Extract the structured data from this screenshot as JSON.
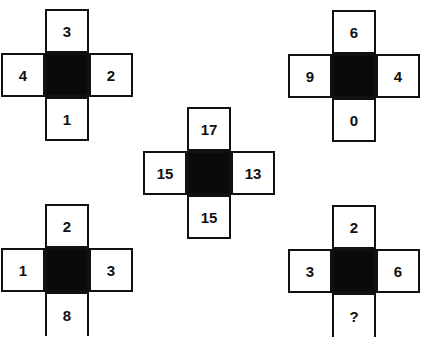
{
  "puzzle": {
    "crosses": [
      {
        "position": "top-left",
        "top": "3",
        "left": "4",
        "right": "2",
        "bottom": "1"
      },
      {
        "position": "top-right",
        "top": "6",
        "left": "9",
        "right": "4",
        "bottom": "0"
      },
      {
        "position": "center",
        "top": "17",
        "left": "15",
        "right": "13",
        "bottom": "15"
      },
      {
        "position": "bottom-left",
        "top": "2",
        "left": "1",
        "right": "3",
        "bottom": "8"
      },
      {
        "position": "bottom-right",
        "top": "2",
        "left": "3",
        "right": "6",
        "bottom": "?"
      }
    ]
  }
}
